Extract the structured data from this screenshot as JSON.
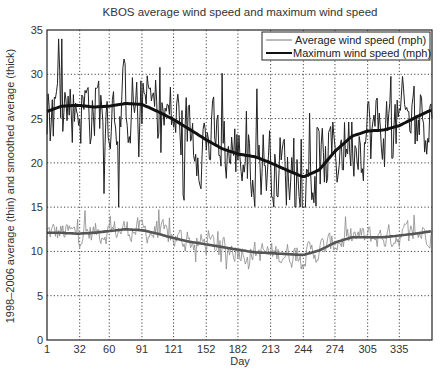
{
  "chart_data": {
    "type": "line",
    "title": "KBOS average wind speed and maximum wind speed",
    "xlabel": "Day",
    "ylabel": "1998–2006 average (thin) and smoothed average (thick)",
    "xlim": [
      1,
      366
    ],
    "ylim": [
      0,
      35
    ],
    "x_ticks": [
      1,
      32,
      60,
      91,
      121,
      152,
      182,
      213,
      244,
      274,
      305,
      335
    ],
    "y_ticks": [
      0,
      5,
      10,
      15,
      20,
      25,
      30,
      35
    ],
    "grid": true,
    "grid_style": "dotted",
    "legend_position": "upper right",
    "legend": [
      "Average wind speed (mph)",
      "Maximum wind speed (mph)"
    ],
    "series": [
      {
        "name": "Maximum wind speed (mph) - smoothed",
        "style": "thick",
        "color": "#111111",
        "x": [
          1,
          15,
          30,
          45,
          60,
          75,
          91,
          106,
          121,
          136,
          152,
          167,
          182,
          198,
          213,
          228,
          244,
          259,
          274,
          290,
          305,
          320,
          335,
          350,
          366
        ],
        "values": [
          25.8,
          26.4,
          26.5,
          26.3,
          26.4,
          26.7,
          26.6,
          25.8,
          24.9,
          23.8,
          22.6,
          21.6,
          21.0,
          20.7,
          20.0,
          19.2,
          18.4,
          19.2,
          21.3,
          23.0,
          23.6,
          23.7,
          24.2,
          25.1,
          26.0
        ]
      },
      {
        "name": "Average wind speed (mph) - smoothed",
        "style": "thick",
        "color": "#555555",
        "x": [
          1,
          15,
          30,
          45,
          60,
          75,
          91,
          106,
          121,
          136,
          152,
          167,
          182,
          198,
          213,
          228,
          244,
          259,
          274,
          290,
          305,
          320,
          335,
          350,
          366
        ],
        "values": [
          12.1,
          12.1,
          12.0,
          12.1,
          12.3,
          12.5,
          12.4,
          12.0,
          11.5,
          11.1,
          10.8,
          10.5,
          10.2,
          9.9,
          9.8,
          9.7,
          9.6,
          10.1,
          11.0,
          11.6,
          11.6,
          11.6,
          11.8,
          12.0,
          12.3
        ]
      },
      {
        "name": "Maximum wind speed (mph) - daily",
        "style": "thin",
        "color": "#222222",
        "noise_amplitude": 5.5,
        "range_observed": [
          15,
          34
        ]
      },
      {
        "name": "Average wind speed (mph) - daily",
        "style": "thin",
        "color": "#8a8a8a",
        "noise_amplitude": 1.6,
        "range_observed": [
          8,
          16
        ]
      }
    ]
  },
  "labels": {
    "title": "KBOS average wind speed and maximum wind speed",
    "xlabel": "Day",
    "ylabel": "1998–2006 average (thin) and smoothed average (thick)",
    "legend_avg": "Average wind speed (mph)",
    "legend_max": "Maximum wind speed (mph)"
  }
}
